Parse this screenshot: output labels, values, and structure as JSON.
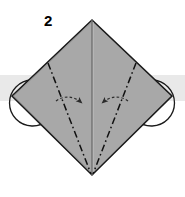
{
  "figure": {
    "kind": "origami-fold-diagram",
    "step_label": "2",
    "canvas": {
      "width": 185,
      "height": 197,
      "background": "#ffffff"
    }
  },
  "colors": {
    "paper_fill": "#a8a8a8",
    "paper_outline": "#1a1a1a",
    "crease_line": "#6f6f6f",
    "fold_line": "#111111",
    "arrow": "#2b2b2b",
    "band_fill": "#e9e9e9",
    "background": "#ffffff",
    "label_text": "#000000"
  },
  "shapes": {
    "background_band": {
      "name": "horizontal-band",
      "x": 0,
      "y": 75,
      "width": 185,
      "height": 26
    },
    "paper_diamond": {
      "name": "square-base-diamond",
      "points": "92,20 172,96 92,175 12,96",
      "top_vertex": [
        92,
        20
      ],
      "right_vertex": [
        172,
        96
      ],
      "bottom_vertex": [
        92,
        175
      ],
      "left_vertex": [
        12,
        96
      ]
    },
    "center_crease": {
      "from": [
        92,
        20
      ],
      "to": [
        92,
        175
      ]
    },
    "left_flap_arc": {
      "cx": 30,
      "cy": 101,
      "rx": 22,
      "ry": 22
    },
    "right_flap_arc": {
      "cx": 154,
      "cy": 101,
      "rx": 22,
      "ry": 22
    },
    "fold_line_left": {
      "from": [
        48,
        63
      ],
      "to": [
        91,
        174
      ]
    },
    "fold_line_right": {
      "from": [
        136,
        63
      ],
      "to": [
        93,
        174
      ]
    },
    "arrow_left": {
      "from": [
        60,
        106
      ],
      "to": [
        84,
        104
      ]
    },
    "arrow_right": {
      "from": [
        124,
        106
      ],
      "to": [
        100,
        104
      ]
    }
  },
  "legend": {
    "fold_line_style": "dash-dot",
    "arrow_count": 2,
    "arc_count": 2
  }
}
